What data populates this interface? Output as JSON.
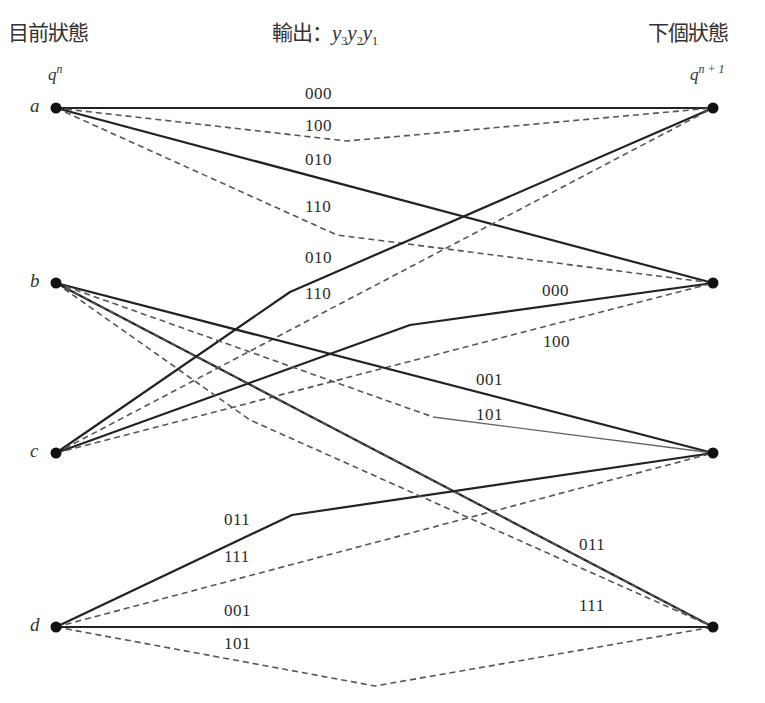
{
  "headers": {
    "current_state": "目前狀態",
    "output_prefix": "輸出：",
    "output_vars": [
      "y",
      "3",
      "y",
      "2",
      "y",
      "1"
    ],
    "next_state": "下個狀態"
  },
  "column_labels": {
    "left": {
      "base": "q",
      "sup": "n"
    },
    "right": {
      "base": "q",
      "sup": "n + 1"
    }
  },
  "states": [
    "a",
    "b",
    "c",
    "d"
  ],
  "legend_styles": {
    "solid": "#222222",
    "dashed": "#555555"
  },
  "edges": [
    {
      "from": "a",
      "to": "a",
      "label": "000",
      "style": "solid"
    },
    {
      "from": "a",
      "to": "a",
      "label": "100",
      "style": "dashed"
    },
    {
      "from": "a",
      "to": "b",
      "label": "010",
      "style": "solid"
    },
    {
      "from": "a",
      "to": "b",
      "label": "110",
      "style": "dashed"
    },
    {
      "from": "c",
      "to": "a",
      "label": "010",
      "style": "solid"
    },
    {
      "from": "c",
      "to": "a",
      "label": "110",
      "style": "dashed"
    },
    {
      "from": "c",
      "to": "b",
      "label": "000",
      "style": "solid"
    },
    {
      "from": "c",
      "to": "b",
      "label": "100",
      "style": "dashed"
    },
    {
      "from": "b",
      "to": "c",
      "label": "001",
      "style": "solid"
    },
    {
      "from": "b",
      "to": "c",
      "label": "101",
      "style": "dashed"
    },
    {
      "from": "d",
      "to": "c",
      "label": "011",
      "style": "solid"
    },
    {
      "from": "d",
      "to": "c",
      "label": "111",
      "style": "dashed"
    },
    {
      "from": "b",
      "to": "d",
      "label": "011",
      "style": "solid"
    },
    {
      "from": "b",
      "to": "d",
      "label": "111",
      "style": "dashed"
    },
    {
      "from": "d",
      "to": "d",
      "label": "001",
      "style": "solid"
    },
    {
      "from": "d",
      "to": "d",
      "label": "101",
      "style": "dashed"
    }
  ]
}
